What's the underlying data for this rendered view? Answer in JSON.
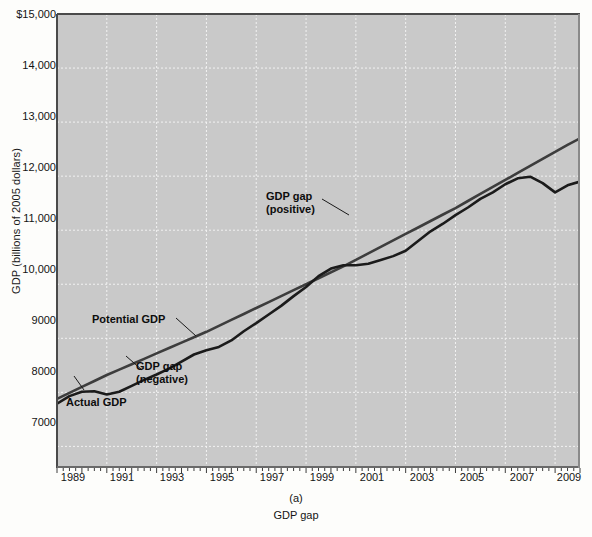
{
  "axes": {
    "y_title": "GDP (billions of 2005 dollars)",
    "y_ticks": [
      {
        "label": "$15,000",
        "value": 15000
      },
      {
        "label": "14,000",
        "value": 14000
      },
      {
        "label": "13,000",
        "value": 13000
      },
      {
        "label": "12,000",
        "value": 12000
      },
      {
        "label": "11,000",
        "value": 11000
      },
      {
        "label": "10,000",
        "value": 10000
      },
      {
        "label": "9000",
        "value": 9000
      },
      {
        "label": "8000",
        "value": 8000
      },
      {
        "label": "7000",
        "value": 7000
      }
    ],
    "x_ticks": [
      {
        "label": "1989",
        "value": 1989
      },
      {
        "label": "1991",
        "value": 1991
      },
      {
        "label": "1993",
        "value": 1993
      },
      {
        "label": "1995",
        "value": 1995
      },
      {
        "label": "1997",
        "value": 1997
      },
      {
        "label": "1999",
        "value": 1999
      },
      {
        "label": "2001",
        "value": 2001
      },
      {
        "label": "2003",
        "value": 2003
      },
      {
        "label": "2005",
        "value": 2005
      },
      {
        "label": "2007",
        "value": 2007
      },
      {
        "label": "2009",
        "value": 2009
      }
    ]
  },
  "caption": {
    "panel": "(a)",
    "title": "GDP gap"
  },
  "annotations": [
    {
      "name": "potential-gdp",
      "text": "Potential GDP",
      "x": 92,
      "y": 313
    },
    {
      "name": "actual-gdp",
      "text": "Actual GDP",
      "x": 66,
      "y": 396
    },
    {
      "name": "gdp-gap-negative",
      "line1": "GDP gap",
      "line2": "(negative)",
      "x": 136,
      "y": 366
    },
    {
      "name": "gdp-gap-positive",
      "line1": "GDP gap",
      "line2": "(positive)",
      "x": 266,
      "y": 190
    }
  ],
  "colors": {
    "plot_background": "#c9c9c9",
    "gridline": "#f2f2f2",
    "actual_line": "#1c1c1c",
    "potential_line": "#3a3a3a",
    "gap_fill": "#a8a8a8",
    "page_background": "#fdfdfb",
    "text": "#141414"
  },
  "chart_data": {
    "type": "line",
    "title": "GDP gap",
    "xlabel": "",
    "ylabel": "GDP (billions of 2005 dollars)",
    "xlim": [
      1989,
      2010
    ],
    "ylim": [
      6600,
      15000
    ],
    "grid": true,
    "legend": "annotations on plot",
    "x": [
      1989,
      1989.5,
      1990,
      1990.5,
      1991,
      1991.5,
      1992,
      1992.5,
      1993,
      1993.5,
      1994,
      1994.5,
      1995,
      1995.5,
      1996,
      1996.5,
      1997,
      1997.5,
      1998,
      1998.5,
      1999,
      1999.5,
      2000,
      2000.5,
      2001,
      2001.5,
      2002,
      2002.5,
      2003,
      2003.5,
      2004,
      2004.5,
      2005,
      2005.5,
      2006,
      2006.5,
      2007,
      2007.5,
      2008,
      2008.5,
      2009,
      2009.5,
      2010
    ],
    "series": [
      {
        "name": "Actual GDP",
        "values": [
          7790,
          7930,
          8010,
          8020,
          7960,
          8010,
          8120,
          8230,
          8330,
          8440,
          8570,
          8700,
          8780,
          8840,
          8960,
          9130,
          9280,
          9440,
          9600,
          9780,
          9950,
          10150,
          10290,
          10350,
          10350,
          10380,
          10450,
          10520,
          10620,
          10800,
          10980,
          11120,
          11280,
          11420,
          11580,
          11700,
          11850,
          11960,
          11990,
          11870,
          11700,
          11830,
          11900
        ]
      },
      {
        "name": "Potential GDP",
        "values": [
          7880,
          7990,
          8100,
          8210,
          8320,
          8420,
          8520,
          8620,
          8720,
          8820,
          8920,
          9020,
          9120,
          9230,
          9340,
          9450,
          9560,
          9670,
          9780,
          9890,
          10000,
          10110,
          10220,
          10330,
          10450,
          10570,
          10690,
          10810,
          10930,
          11050,
          11170,
          11290,
          11410,
          11540,
          11670,
          11800,
          11930,
          12060,
          12190,
          12320,
          12450,
          12580,
          12700
        ]
      }
    ],
    "notes": [
      "Shaded region between 1997 and 2001 marks the positive GDP gap (actual above potential).",
      "Gap between 1989 and 1996 marks the negative GDP gap (actual below potential).",
      "Sharp decline in actual GDP in 2008-2009 marks the recession."
    ]
  }
}
